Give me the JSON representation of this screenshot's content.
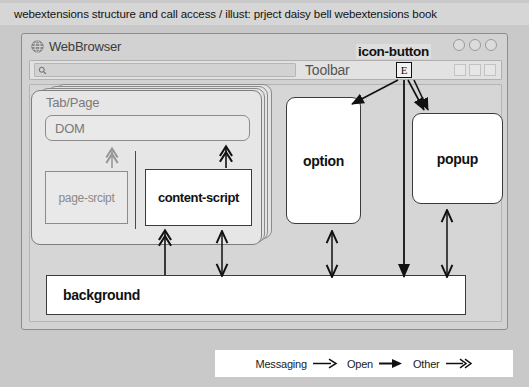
{
  "caption": {
    "text": "webextensions structure and call access / illust: prject daisy bell webextensions book"
  },
  "browser": {
    "title": "WebBrowser",
    "globe_icon": "globe-icon",
    "window_controls": [
      {
        "name": "minimize-button",
        "icon": "circle-icon"
      },
      {
        "name": "maximize-button",
        "icon": "circle-icon"
      },
      {
        "name": "close-button",
        "icon": "circle-icon"
      }
    ],
    "toolbar": {
      "label": "Toolbar",
      "search_icon": "search-icon",
      "url_value": "",
      "url_placeholder": "",
      "right_icons": [
        "square-icon",
        "square-icon",
        "square-icon"
      ]
    },
    "icon_button": {
      "label": "icon-button",
      "glyph": "E"
    }
  },
  "diagram": {
    "tab_page": {
      "label": "Tab/Page",
      "dom": "DOM",
      "page_script": "page-srcipt",
      "content_script": "content-script",
      "stack_count": 4
    },
    "option": "option",
    "popup": "popup",
    "background": "background"
  },
  "legend": {
    "items": [
      {
        "label": "Messaging",
        "arrow": "thin-open-arrow-icon"
      },
      {
        "label": "Open",
        "arrow": "solid-filled-arrow-icon"
      },
      {
        "label": "Other",
        "arrow": "double-chevron-arrow-icon"
      }
    ]
  },
  "colors": {
    "page_background": "#c9c9c9",
    "caption_background": "#d6d6d6",
    "window_chrome": "#d2d2d2",
    "viewport": "#d6d6d6",
    "muted_text": "#7a7a7a",
    "box_fill": "#ffffff",
    "stroke": "#3b3b3b"
  }
}
